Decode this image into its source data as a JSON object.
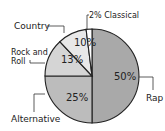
{
  "chart_data": {
    "type": "pie",
    "title": "",
    "categories": [
      "Rap",
      "Alternative",
      "Rock and Roll",
      "Country",
      "Classical"
    ],
    "values": [
      50,
      25,
      13,
      10,
      2
    ],
    "unit": "%",
    "slice_labels": [
      "50%",
      "25%",
      "13%",
      "10%",
      "2%"
    ],
    "colors": [
      "#a9a9a9",
      "#bcbcbc",
      "#d5d5d5",
      "#e8e8e8",
      "#ffffff"
    ],
    "start_angle": "12 o'clock",
    "direction": "clockwise",
    "legend": "none (leader-line callout labels)",
    "callouts": {
      "rap": "Rap",
      "alternative": "Alternative",
      "rock_and_roll_line1": "Rock and",
      "rock_and_roll_line2": "Roll",
      "country": "Country",
      "classical": "2% Classical"
    }
  }
}
